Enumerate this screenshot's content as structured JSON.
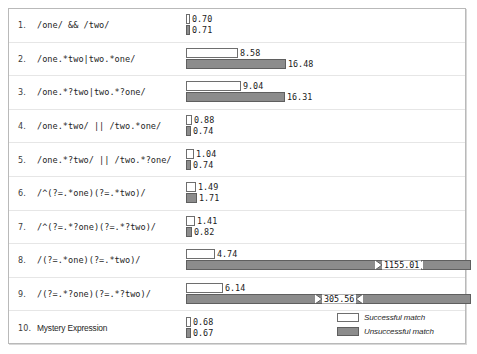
{
  "chart_data": {
    "type": "bar",
    "title": "",
    "xlabel": "",
    "ylabel": "",
    "orientation": "horizontal",
    "grid": false,
    "legend_position": "bottom-right",
    "px_per_unit": 6.05,
    "categories": [
      "/one/ && /two/",
      "/one.*two|two.*one/",
      "/one.*?two|two.*?one/",
      "/one.*two/ || /two.*one/",
      "/one.*?two/ || /two.*?one/",
      "/^(?=.*one)(?=.*two)/",
      "/^(?=.*?one)(?=.*?two)/",
      "/(?=.*one)(?=.*two)/",
      "/(?=.*?one)(?=.*?two)/",
      "Mystery Expression"
    ],
    "series": [
      {
        "name": "Successful match",
        "color": "#ffffff",
        "values": [
          0.7,
          8.58,
          9.04,
          0.88,
          1.04,
          1.49,
          1.41,
          4.74,
          6.14,
          0.68
        ]
      },
      {
        "name": "Unsuccessful match",
        "color": "#8c8c8c",
        "values": [
          0.71,
          16.48,
          16.31,
          0.74,
          0.74,
          1.71,
          0.82,
          1155.01,
          305.56,
          0.67
        ]
      }
    ],
    "broken_axis_bars": [
      {
        "row": 8,
        "series": "Unsuccessful match",
        "value": 1155.01
      },
      {
        "row": 9,
        "series": "Unsuccessful match",
        "value": 305.56
      }
    ]
  },
  "rows": [
    {
      "index": "1.",
      "expression": "/one/ && /two/",
      "mono": true,
      "success": {
        "label": "0.70",
        "value": 0.7,
        "width": 4
      },
      "unsuccess": {
        "label": "0.71",
        "value": 0.71,
        "width": 4,
        "broken": false
      }
    },
    {
      "index": "2.",
      "expression": "/one.*two|two.*one/",
      "mono": true,
      "success": {
        "label": "8.58",
        "value": 8.58,
        "width": 52
      },
      "unsuccess": {
        "label": "16.48",
        "value": 16.48,
        "width": 100,
        "broken": false
      }
    },
    {
      "index": "3.",
      "expression": "/one.*?two|two.*?one/",
      "mono": true,
      "success": {
        "label": "9.04",
        "value": 9.04,
        "width": 55
      },
      "unsuccess": {
        "label": "16.31",
        "value": 16.31,
        "width": 99,
        "broken": false
      }
    },
    {
      "index": "4.",
      "expression": "/one.*two/ || /two.*one/",
      "mono": true,
      "success": {
        "label": "0.88",
        "value": 0.88,
        "width": 6
      },
      "unsuccess": {
        "label": "0.74",
        "value": 0.74,
        "width": 5,
        "broken": false
      }
    },
    {
      "index": "5.",
      "expression": "/one.*?two/ || /two.*?one/",
      "mono": true,
      "success": {
        "label": "1.04",
        "value": 1.04,
        "width": 8
      },
      "unsuccess": {
        "label": "0.74",
        "value": 0.74,
        "width": 5,
        "broken": false
      }
    },
    {
      "index": "6.",
      "expression": "/^(?=.*one)(?=.*two)/",
      "mono": true,
      "success": {
        "label": "1.49",
        "value": 1.49,
        "width": 10
      },
      "unsuccess": {
        "label": "1.71",
        "value": 1.71,
        "width": 11,
        "broken": false
      }
    },
    {
      "index": "7.",
      "expression": "/^(?=.*?one)(?=.*?two)/",
      "mono": true,
      "success": {
        "label": "1.41",
        "value": 1.41,
        "width": 9
      },
      "unsuccess": {
        "label": "0.82",
        "value": 0.82,
        "width": 6,
        "broken": false
      }
    },
    {
      "index": "8.",
      "expression": "/(?=.*one)(?=.*two)/",
      "mono": true,
      "success": {
        "label": "4.74",
        "value": 4.74,
        "width": 29
      },
      "unsuccess": {
        "label": "1155.01",
        "value": 1155.01,
        "width": 285,
        "broken": true,
        "break_at": 190
      }
    },
    {
      "index": "9.",
      "expression": "/(?=.*?one)(?=.*?two)/",
      "mono": true,
      "success": {
        "label": "6.14",
        "value": 6.14,
        "width": 37
      },
      "unsuccess": {
        "label": "305.56",
        "value": 305.56,
        "width": 285,
        "broken": true,
        "break_at": 130
      }
    },
    {
      "index": "10.",
      "expression": "Mystery Expression",
      "mono": false,
      "success": {
        "label": "0.68",
        "value": 0.68,
        "width": 5
      },
      "unsuccess": {
        "label": "0.67",
        "value": 0.67,
        "width": 5,
        "broken": false
      }
    }
  ],
  "legend": {
    "items": [
      {
        "label": "Successful match",
        "swatch": "succ"
      },
      {
        "label": "Unsuccessful match",
        "swatch": "unsucc"
      }
    ]
  }
}
